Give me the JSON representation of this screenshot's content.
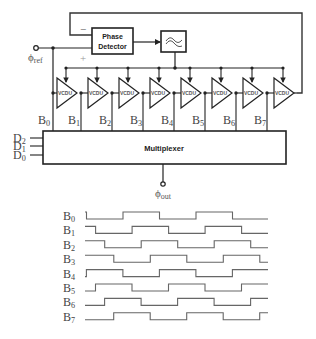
{
  "circuit": {
    "phase_detector": {
      "line1": "Phase",
      "line2": "Detector"
    },
    "minus_sign": "−",
    "plus_sign": "+",
    "input_label": {
      "base": "ϕ",
      "sub": "ref"
    },
    "output_label": {
      "base": "ϕ",
      "sub": "out"
    },
    "filter_icon": "low-pass-filter-icon",
    "buffer_label": "VCDU",
    "buffer_count": 8,
    "tap_labels": [
      {
        "base": "B",
        "sub": "0"
      },
      {
        "base": "B",
        "sub": "1"
      },
      {
        "base": "B",
        "sub": "2"
      },
      {
        "base": "B",
        "sub": "3"
      },
      {
        "base": "B",
        "sub": "4"
      },
      {
        "base": "B",
        "sub": "5"
      },
      {
        "base": "B",
        "sub": "6"
      },
      {
        "base": "B",
        "sub": "7"
      }
    ],
    "select_labels": [
      {
        "base": "D",
        "sub": "2"
      },
      {
        "base": "D",
        "sub": "1"
      },
      {
        "base": "D",
        "sub": "0"
      }
    ],
    "multiplexer_label": "Multiplexer"
  },
  "timing": {
    "signals": [
      {
        "base": "B",
        "sub": "0"
      },
      {
        "base": "B",
        "sub": "1"
      },
      {
        "base": "B",
        "sub": "2"
      },
      {
        "base": "B",
        "sub": "3"
      },
      {
        "base": "B",
        "sub": "4"
      },
      {
        "base": "B",
        "sub": "5"
      },
      {
        "base": "B",
        "sub": "6"
      },
      {
        "base": "B",
        "sub": "7"
      }
    ],
    "phase_step_fraction": 0.125
  }
}
